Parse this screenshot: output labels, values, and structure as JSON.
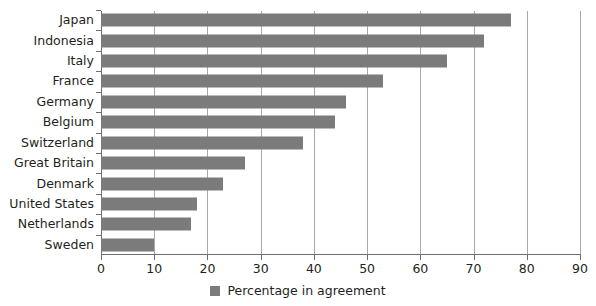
{
  "chart_data": {
    "type": "bar",
    "orientation": "horizontal",
    "title": "",
    "subtitle": "",
    "xlabel": "",
    "ylabel": "",
    "categories": [
      "Japan",
      "Indonesia",
      "Italy",
      "France",
      "Germany",
      "Belgium",
      "Switzerland",
      "Great Britain",
      "Denmark",
      "United States",
      "Netherlands",
      "Sweden"
    ],
    "values": [
      77,
      72,
      65,
      53,
      46,
      44,
      38,
      27,
      23,
      18,
      17,
      10
    ],
    "series": [
      {
        "name": "Percentage in agreement",
        "values": [
          77,
          72,
          65,
          53,
          46,
          44,
          38,
          27,
          23,
          18,
          17,
          10
        ],
        "color": "#7b7b7b"
      }
    ],
    "xlim": [
      0,
      90
    ],
    "xticks": [
      0,
      10,
      20,
      30,
      40,
      50,
      60,
      70,
      80,
      90
    ],
    "xtick_labels": [
      "0",
      "10",
      "20",
      "30",
      "40",
      "50",
      "60",
      "70",
      "80",
      "90"
    ],
    "grid": "vertical",
    "legend": {
      "position": "bottom-center",
      "entries": [
        {
          "label": "Percentage in agreement",
          "color": "#7b7b7b",
          "swatch": "square-swatch"
        }
      ]
    },
    "colors": {
      "bar": "#7b7b7b",
      "gridline": "#a9a9a9",
      "axis": "#6e6e6e",
      "text": "#231f20",
      "background": "#ffffff"
    }
  }
}
